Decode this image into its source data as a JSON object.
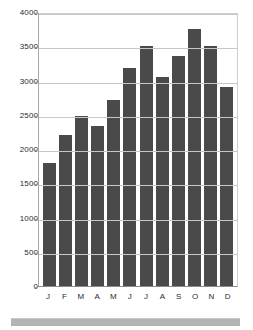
{
  "chart_data": {
    "type": "bar",
    "title": "",
    "subtitle": "",
    "xlabel": "",
    "ylabel": "",
    "categories": [
      "J",
      "F",
      "M",
      "A",
      "M",
      "J",
      "J",
      "A",
      "S",
      "O",
      "N",
      "D"
    ],
    "values": [
      1800,
      2200,
      2480,
      2330,
      2710,
      3180,
      3510,
      3050,
      3360,
      3750,
      3500,
      2910
    ],
    "series": [
      {
        "name": "Monthly value",
        "values": [
          1800,
          2200,
          2480,
          2330,
          2710,
          3180,
          3510,
          3050,
          3360,
          3750,
          3500,
          2910
        ]
      }
    ],
    "ylim": [
      0,
      4000
    ],
    "ytick_labels": [
      "0",
      "500",
      "1000",
      "1500",
      "2000",
      "2500",
      "3000",
      "3500",
      "4000"
    ],
    "ytick_values": [
      0,
      500,
      1000,
      1500,
      2000,
      2500,
      3000,
      3500,
      4000
    ],
    "grid": true,
    "legend": false,
    "legend_position": "none",
    "annotations": [],
    "colors": {
      "bar": "#4a4a4a",
      "gridline": "#c8c8c8",
      "axis": "#8a8a8a",
      "text": "#2b2b2b",
      "background": "#ffffff",
      "footer_band": "#b4b4b4"
    }
  },
  "footer": {
    "band_label": ""
  }
}
